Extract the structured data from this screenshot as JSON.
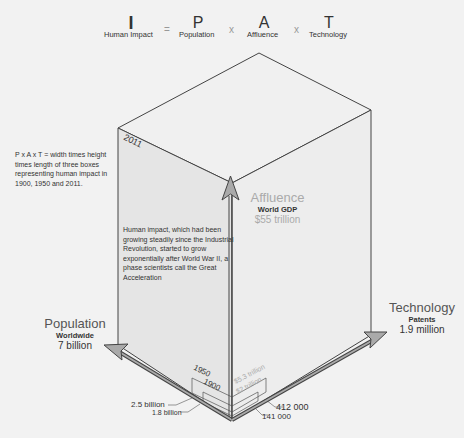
{
  "equation": {
    "impact": {
      "letter": "I",
      "label": "Human Impact"
    },
    "equals": "=",
    "population": {
      "letter": "P",
      "label": "Population"
    },
    "times1": "x",
    "affluence": {
      "letter": "A",
      "label": "Affluence"
    },
    "times2": "x",
    "technology": {
      "letter": "T",
      "label": "Technology"
    }
  },
  "note": "P x A x T = width times height times length of three boxes representing human impact in 1900, 1950 and 2011.",
  "description": "Human impact, which had been growing steadily since the Industrial Revolution, started to grow exponentially after World War II, a phase scientists call the  Great Acceleration",
  "years": {
    "y2011": "2011",
    "y1950": "1950",
    "y1900": "1900"
  },
  "affluence": {
    "title": "Affluence",
    "subtitle": "World GDP",
    "value": "$55 trillion",
    "v1950": "$5.3 trillion",
    "v1900": "$2 trillion"
  },
  "population": {
    "title": "Population",
    "subtitle": "Worldwide",
    "value": "7 billion",
    "v1950": "2.5 billion",
    "v1900": "1.8 billion"
  },
  "technology": {
    "title": "Technology",
    "subtitle": "Patents",
    "value": "1.9 million",
    "v1950": "412 000",
    "v1900": "141 000"
  },
  "colors": {
    "background": "#f2f2f2",
    "left_face": "#e6e6e6",
    "right_face": "#eeeeee",
    "top_face": "#f0f0f0",
    "edge": "#444444",
    "arrow_fill": "#aaaaaa"
  }
}
